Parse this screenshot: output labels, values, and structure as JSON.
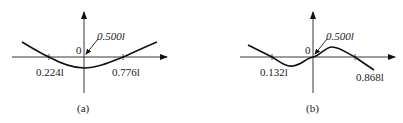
{
  "figures": [
    {
      "id": "a",
      "caption": "(a)",
      "origin_label": "0",
      "annotation": "0.500l",
      "tick_labels": [
        "0.224l",
        "0.776l"
      ],
      "description": "Symmetric curve, minimum at center, crossing axis at 0.224l and 0.776l"
    },
    {
      "id": "b",
      "caption": "(b)",
      "origin_label": "0",
      "annotation": "0.500l",
      "tick_labels": [
        "0.132l",
        "0.868l"
      ],
      "description": "Antisymmetric curve passing through origin at 0.500l, crossing axis at 0.132l and 0.868l"
    }
  ]
}
